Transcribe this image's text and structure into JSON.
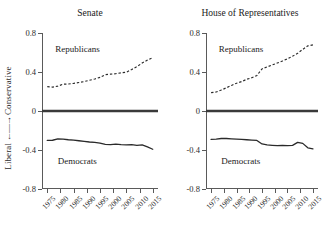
{
  "axis_label": {
    "left_word": "Liberal",
    "arrow": "←—→",
    "right_word": "Conservative",
    "full": "Liberal ←—→ Conservative"
  },
  "panels": [
    {
      "key": "senate",
      "title": "Senate",
      "republican_label": "Republicans",
      "democrat_label": "Democrats"
    },
    {
      "key": "house",
      "title": "House of Representatives",
      "republican_label": "Republicans",
      "democrat_label": "Democrats"
    }
  ],
  "chart_data": [
    {
      "type": "line",
      "title": "Senate",
      "xlabel": "",
      "ylabel": "Liberal ←—→ Conservative",
      "xlim": [
        1973,
        2017
      ],
      "ylim": [
        -0.8,
        0.8
      ],
      "yticks": [
        0.8,
        0.4,
        0,
        -0.4,
        -0.8
      ],
      "ytick_labels": [
        "0.8",
        "0.4",
        "0",
        "-0.4",
        "-0.8"
      ],
      "xticks": [
        1975,
        1980,
        1985,
        1990,
        1995,
        2000,
        2005,
        2010,
        2015
      ],
      "xtick_labels": [
        "1975",
        "1980",
        "1985",
        "1990",
        "1995",
        "2000",
        "2005",
        "2010",
        "2015"
      ],
      "grid": false,
      "legend": "inline-annotations",
      "reference_line": {
        "y": 0,
        "style": "solid-thick"
      },
      "x": [
        1975,
        1977,
        1979,
        1981,
        1983,
        1985,
        1987,
        1989,
        1991,
        1993,
        1995,
        1997,
        1999,
        2001,
        2003,
        2005,
        2007,
        2009,
        2011,
        2013,
        2015
      ],
      "series": [
        {
          "name": "Republicans",
          "style": "dashed",
          "values": [
            0.25,
            0.245,
            0.255,
            0.275,
            0.277,
            0.283,
            0.292,
            0.302,
            0.315,
            0.328,
            0.345,
            0.372,
            0.378,
            0.383,
            0.392,
            0.398,
            0.425,
            0.455,
            0.492,
            0.522,
            0.548
          ]
        },
        {
          "name": "Democrats",
          "style": "solid",
          "values": [
            -0.302,
            -0.3,
            -0.285,
            -0.288,
            -0.295,
            -0.298,
            -0.305,
            -0.312,
            -0.318,
            -0.322,
            -0.33,
            -0.342,
            -0.345,
            -0.34,
            -0.345,
            -0.348,
            -0.345,
            -0.352,
            -0.348,
            -0.368,
            -0.392
          ]
        }
      ]
    },
    {
      "type": "line",
      "title": "House of Representatives",
      "xlabel": "",
      "ylabel": "Liberal ←—→ Conservative",
      "xlim": [
        1973,
        2017
      ],
      "ylim": [
        -0.8,
        0.8
      ],
      "yticks": [
        0.8,
        0.4,
        0,
        -0.4,
        -0.8
      ],
      "ytick_labels": [
        "0.8",
        "0.4",
        "0",
        "-0.4",
        "-0.8"
      ],
      "xticks": [
        1975,
        1980,
        1985,
        1990,
        1995,
        2000,
        2005,
        2010,
        2015
      ],
      "xtick_labels": [
        "1975",
        "1980",
        "1985",
        "1990",
        "1995",
        "2000",
        "2005",
        "2010",
        "2015"
      ],
      "grid": false,
      "legend": "inline-annotations",
      "reference_line": {
        "y": 0,
        "style": "solid-thick"
      },
      "x": [
        1975,
        1977,
        1979,
        1981,
        1983,
        1985,
        1987,
        1989,
        1991,
        1993,
        1995,
        1997,
        1999,
        2001,
        2003,
        2005,
        2007,
        2009,
        2011,
        2013,
        2015
      ],
      "series": [
        {
          "name": "Republicans",
          "style": "dashed",
          "values": [
            0.188,
            0.195,
            0.215,
            0.238,
            0.262,
            0.285,
            0.302,
            0.325,
            0.342,
            0.365,
            0.432,
            0.452,
            0.472,
            0.492,
            0.512,
            0.535,
            0.562,
            0.592,
            0.632,
            0.668,
            0.678
          ]
        },
        {
          "name": "Democrats",
          "style": "solid",
          "values": [
            -0.292,
            -0.288,
            -0.282,
            -0.282,
            -0.285,
            -0.288,
            -0.292,
            -0.295,
            -0.298,
            -0.302,
            -0.338,
            -0.348,
            -0.352,
            -0.355,
            -0.352,
            -0.355,
            -0.352,
            -0.322,
            -0.332,
            -0.378,
            -0.388
          ]
        }
      ]
    }
  ],
  "colors": {
    "axis": "#5a5a5a",
    "line": "#2a2a2a",
    "zero_line": "#3a3a3a",
    "text": "#1a1a1a",
    "background": "#ffffff"
  }
}
